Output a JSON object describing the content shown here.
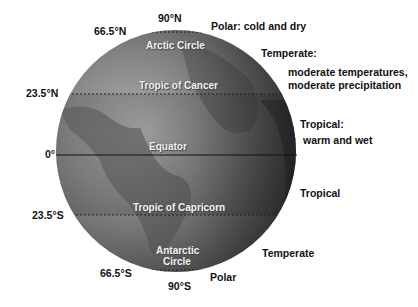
{
  "figure": {
    "latitude_labels": {
      "north_pole": "90°N",
      "arctic_circle": "66.5°N",
      "tropic_cancer": "23.5°N",
      "equator": "0°",
      "tropic_capricorn": "23.5°S",
      "antarctic_circle": "66.5°S",
      "south_pole": "90°S"
    },
    "globe_labels": {
      "arctic_circle": "Arctic Circle",
      "tropic_cancer": "Tropic of Cancer",
      "equator": "Equator",
      "tropic_capricorn": "Tropic of Capricorn",
      "antarctic_line1": "Antarctic",
      "antarctic_line2": "Circle"
    },
    "zone_labels": {
      "polar_north": "Polar: cold and dry",
      "temperate_north_title": "Temperate:",
      "temperate_north_desc1": "moderate temperatures,",
      "temperate_north_desc2": "moderate precipitation",
      "tropical_north_title": "Tropical:",
      "tropical_north_desc": "warm and wet",
      "tropical_south": "Tropical",
      "temperate_south": "Temperate",
      "polar_south": "Polar"
    },
    "colors": {
      "globe_light": "#b8b8b8",
      "globe_mid": "#8a8a8a",
      "globe_dark": "#3e3e3e",
      "line": "#222222",
      "text": "#111111"
    }
  }
}
